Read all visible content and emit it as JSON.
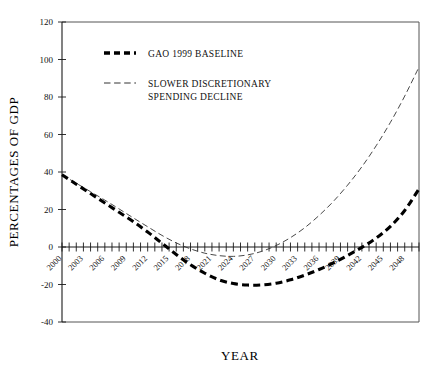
{
  "chart_data": {
    "type": "line",
    "title": "",
    "xlabel": "YEAR",
    "ylabel": "PERCENTAGES OF GDP",
    "xlim": [
      2000,
      2050
    ],
    "ylim": [
      -40,
      120
    ],
    "grid": false,
    "legend_position": "top-center",
    "y_ticks": [
      -40,
      -20,
      0,
      20,
      40,
      60,
      80,
      100,
      120
    ],
    "y_tick_labels": [
      "-40",
      "-20",
      "0",
      "20",
      "40",
      "60",
      "80",
      "100",
      "120"
    ],
    "x_tick_labels": [
      "2000",
      "2003",
      "2006",
      "2009",
      "2012",
      "2015",
      "2018",
      "2021",
      "2024",
      "2027",
      "2030",
      "2033",
      "2036",
      "2039",
      "2042",
      "2045",
      "2048"
    ],
    "x_tick_label_values": [
      2000,
      2003,
      2006,
      2009,
      2012,
      2015,
      2018,
      2021,
      2024,
      2027,
      2030,
      2033,
      2036,
      2039,
      2042,
      2045,
      2048
    ],
    "x_minor_tick_step": 1,
    "x": [
      2000,
      2002,
      2004,
      2006,
      2008,
      2010,
      2012,
      2014,
      2016,
      2018,
      2020,
      2022,
      2024,
      2026,
      2028,
      2030,
      2032,
      2034,
      2036,
      2038,
      2040,
      2042,
      2044,
      2046,
      2048,
      2050
    ],
    "series": [
      {
        "name": "GAO 1999 BASELINE",
        "style": "thick-dashed",
        "color": "#000000",
        "values": [
          38.5,
          33.5,
          28.5,
          23.5,
          18.5,
          13.5,
          8.0,
          2.0,
          -4.0,
          -9.5,
          -14.0,
          -17.5,
          -19.5,
          -20.3,
          -20.2,
          -19.3,
          -17.5,
          -15.0,
          -12.0,
          -8.5,
          -4.5,
          -0.2,
          4.8,
          11.0,
          19.5,
          31.0
        ]
      },
      {
        "name": "SLOWER DISCRETIONARY SPENDING DECLINE",
        "style": "thin-dashed",
        "color": "#333333",
        "values": [
          38.5,
          34.0,
          29.5,
          25.0,
          20.3,
          15.5,
          10.8,
          6.2,
          2.2,
          -1.0,
          -3.3,
          -4.6,
          -5.0,
          -4.2,
          -2.3,
          0.8,
          5.0,
          10.3,
          16.8,
          24.3,
          33.0,
          42.8,
          54.0,
          66.5,
          80.5,
          96.0
        ]
      }
    ]
  },
  "legend": {
    "items": [
      {
        "label": "GAO 1999 BASELINE",
        "style": "thick-dashed"
      },
      {
        "label": "SLOWER DISCRETIONARY",
        "label2": "SPENDING DECLINE",
        "style": "thin-dashed"
      }
    ]
  },
  "colors": {
    "background": "#ffffff",
    "axis": "#1a1a1a",
    "frame": "#555555",
    "series_primary": "#000000",
    "series_secondary": "#333333"
  }
}
